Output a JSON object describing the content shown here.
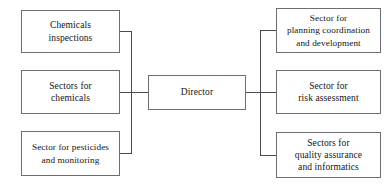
{
  "diagram": {
    "type": "organizational-chart",
    "orientation": "horizontal",
    "center_node": {
      "id": "director",
      "label": "Director"
    },
    "left_nodes": [
      {
        "id": "chemicals-inspections",
        "label": "Chemicals\ninspections"
      },
      {
        "id": "sectors-chemicals",
        "label": "Sectors for\nchemicals"
      },
      {
        "id": "sector-pesticides",
        "label": "Sector for pesticides\nand monitoring"
      }
    ],
    "right_nodes": [
      {
        "id": "planning-coordination",
        "label": "Sector for\nplanning coordination\nand development"
      },
      {
        "id": "risk-assessment",
        "label": "Sector for\nrisk assessment"
      },
      {
        "id": "quality-assurance",
        "label": "Sectors for\nquality assurance\nand informatics"
      }
    ],
    "colors": {
      "background": "#ffffff",
      "box_border": "#6e6e72",
      "connector": "#4a4a50",
      "text": "#131316"
    }
  }
}
